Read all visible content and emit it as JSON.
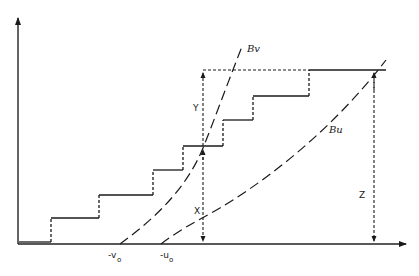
{
  "diagram": {
    "axes": {
      "x_axis": "horizontal arrow",
      "y_axis": "vertical arrow"
    },
    "curves": [
      {
        "id": "Bv",
        "label": "Bv",
        "origin_label": "-v",
        "origin_sub": "o"
      },
      {
        "id": "Bu",
        "label": "Bu",
        "origin_label": "-u",
        "origin_sub": "o"
      }
    ],
    "dimension_labels": {
      "x": "X",
      "y": "Y",
      "z": "Z"
    },
    "staircase_steps": 7
  }
}
